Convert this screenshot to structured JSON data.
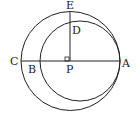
{
  "diagram": {
    "type": "geometry",
    "labels": {
      "E": "E",
      "D": "D",
      "C": "C",
      "B": "B",
      "P": "P",
      "A": "A"
    },
    "outer_circle": {
      "cx": 70.5,
      "cy": 61,
      "r": 49.5
    },
    "inner_circle": {
      "cx": 80,
      "cy": 61,
      "r": 40
    },
    "line_color": "#222222"
  }
}
